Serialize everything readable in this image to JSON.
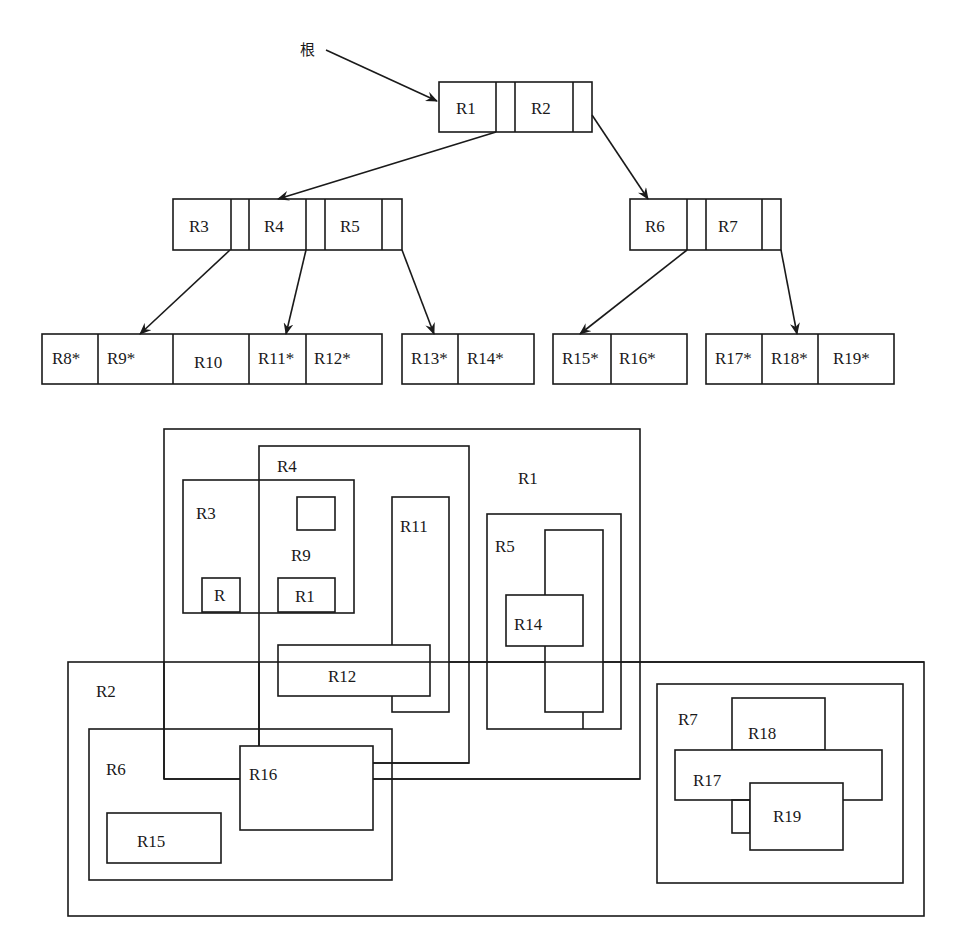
{
  "tree": {
    "root_label": "根",
    "levels": {
      "root": {
        "entries": [
          "R1",
          "R2"
        ]
      },
      "level2": [
        {
          "entries": [
            "R3",
            "R4",
            "R5"
          ]
        },
        {
          "entries": [
            "R6",
            "R7"
          ]
        }
      ],
      "leaves": [
        {
          "entries": [
            "R8*",
            "R9*",
            "R10",
            "R11*",
            "R12*"
          ]
        },
        {
          "entries": [
            "R13*",
            "R14*"
          ]
        },
        {
          "entries": [
            "R15*",
            "R16*"
          ]
        },
        {
          "entries": [
            "R17*",
            "R18*",
            "R19*"
          ]
        }
      ]
    }
  },
  "regions": {
    "R1": "R1",
    "R2": "R2",
    "R3": "R3",
    "R4": "R4",
    "R5": "R5",
    "R6": "R6",
    "R7": "R7",
    "R9": "R9",
    "R_small": "R",
    "R1_small": "R1",
    "R11": "R11",
    "R12": "R12",
    "R14": "R14",
    "R15": "R15",
    "R16": "R16",
    "R17": "R17",
    "R18": "R18",
    "R19": "R19"
  },
  "colors": {
    "stroke": "#1a1a1a",
    "background": "#ffffff"
  }
}
